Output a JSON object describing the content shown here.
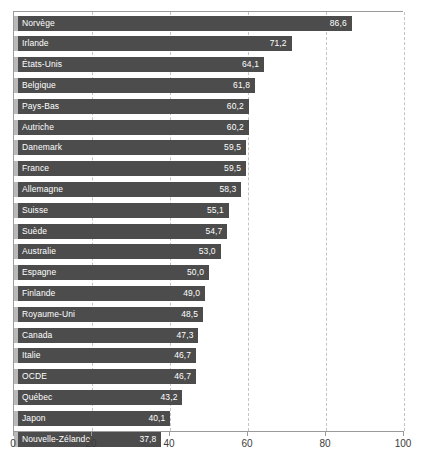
{
  "chart_data": {
    "type": "bar",
    "orientation": "horizontal",
    "title": "",
    "subtitle": "",
    "xlabel": "",
    "ylabel": "",
    "xlim": [
      0,
      100
    ],
    "xticks": [
      0,
      20,
      40,
      60,
      80,
      100
    ],
    "xtick_labels": [
      "0",
      "20",
      "40",
      "60",
      "80",
      "100"
    ],
    "grid": "vertical-dashed",
    "legend": "none",
    "decimal_separator": ",",
    "categories": [
      "Norvège",
      "Irlande",
      "États-Unis",
      "Belgique",
      "Pays-Bas",
      "Autriche",
      "Danemark",
      "France",
      "Allemagne",
      "Suisse",
      "Suède",
      "Australie",
      "Espagne",
      "Finlande",
      "Royaume-Uni",
      "Canada",
      "Italie",
      "OCDE",
      "Québec",
      "Japon",
      "Nouvelle-Zélande"
    ],
    "values": [
      86.6,
      71.2,
      64.1,
      61.8,
      60.2,
      60.2,
      59.5,
      59.5,
      58.3,
      55.1,
      54.7,
      53.0,
      50.0,
      49.0,
      48.5,
      47.3,
      46.7,
      46.7,
      43.2,
      40.1,
      37.8
    ],
    "value_labels": [
      "86,6",
      "71,2",
      "64,1",
      "61,8",
      "60,2",
      "60,2",
      "59,5",
      "59,5",
      "58,3",
      "55,1",
      "54,7",
      "53,0",
      "50,0",
      "49,0",
      "48,5",
      "47,3",
      "46,7",
      "46,7",
      "43,2",
      "40,1",
      "37,8"
    ],
    "bars": [
      {
        "label": "Norvège",
        "value": 86.6,
        "value_label": "86,6"
      },
      {
        "label": "Irlande",
        "value": 71.2,
        "value_label": "71,2"
      },
      {
        "label": "États-Unis",
        "value": 64.1,
        "value_label": "64,1"
      },
      {
        "label": "Belgique",
        "value": 61.8,
        "value_label": "61,8"
      },
      {
        "label": "Pays-Bas",
        "value": 60.2,
        "value_label": "60,2"
      },
      {
        "label": "Autriche",
        "value": 60.2,
        "value_label": "60,2"
      },
      {
        "label": "Danemark",
        "value": 59.5,
        "value_label": "59,5"
      },
      {
        "label": "France",
        "value": 59.5,
        "value_label": "59,5"
      },
      {
        "label": "Allemagne",
        "value": 58.3,
        "value_label": "58,3"
      },
      {
        "label": "Suisse",
        "value": 55.1,
        "value_label": "55,1"
      },
      {
        "label": "Suède",
        "value": 54.7,
        "value_label": "54,7"
      },
      {
        "label": "Australie",
        "value": 53.0,
        "value_label": "53,0"
      },
      {
        "label": "Espagne",
        "value": 50.0,
        "value_label": "50,0"
      },
      {
        "label": "Finlande",
        "value": 49.0,
        "value_label": "49,0"
      },
      {
        "label": "Royaume-Uni",
        "value": 48.5,
        "value_label": "48,5"
      },
      {
        "label": "Canada",
        "value": 47.3,
        "value_label": "47,3"
      },
      {
        "label": "Italie",
        "value": 46.7,
        "value_label": "46,7"
      },
      {
        "label": "OCDE",
        "value": 46.7,
        "value_label": "46,7"
      },
      {
        "label": "Québec",
        "value": 43.2,
        "value_label": "43,2"
      },
      {
        "label": "Japon",
        "value": 40.1,
        "value_label": "40,1"
      },
      {
        "label": "Nouvelle-Zélande",
        "value": 37.8,
        "value_label": "37,8"
      }
    ],
    "colors": {
      "bar_fill": "#4c4c4c",
      "bar_leadin": "#b9b9b9",
      "bar_text": "#ffffff",
      "axis": "#9a9a9a",
      "gridline": "#c4c4c4",
      "tick_text": "#3b3b3b",
      "background": "#ffffff"
    }
  }
}
